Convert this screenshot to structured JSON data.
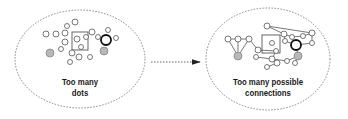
{
  "diagram": {
    "left_panel": {
      "label_line1": "Too many",
      "label_line2": "dots",
      "ellipse": {
        "cx": 80,
        "cy": 59,
        "rx": 65,
        "ry": 49
      },
      "square": {
        "x": 72,
        "y": 32,
        "w": 16,
        "h": 18
      },
      "nodes": [
        {
          "x": 75,
          "y": 22,
          "r": 3,
          "type": "open"
        },
        {
          "x": 67,
          "y": 26,
          "r": 2.5,
          "type": "open"
        },
        {
          "x": 46,
          "y": 34,
          "r": 3,
          "type": "open"
        },
        {
          "x": 56,
          "y": 34,
          "r": 3,
          "type": "open"
        },
        {
          "x": 65,
          "y": 33,
          "r": 3,
          "type": "open"
        },
        {
          "x": 77,
          "y": 39,
          "r": 3,
          "type": "open"
        },
        {
          "x": 86,
          "y": 37,
          "r": 2.5,
          "type": "open"
        },
        {
          "x": 81,
          "y": 47,
          "r": 2.5,
          "type": "open"
        },
        {
          "x": 92,
          "y": 32,
          "r": 3,
          "type": "open"
        },
        {
          "x": 98,
          "y": 37,
          "r": 2.5,
          "type": "open"
        },
        {
          "x": 106,
          "y": 40,
          "r": 5,
          "type": "bold"
        },
        {
          "x": 108,
          "y": 30,
          "r": 2.5,
          "type": "open"
        },
        {
          "x": 116,
          "y": 38,
          "r": 2.5,
          "type": "open"
        },
        {
          "x": 65,
          "y": 42,
          "r": 3,
          "type": "open"
        },
        {
          "x": 50,
          "y": 53,
          "r": 4,
          "type": "filled"
        },
        {
          "x": 61,
          "y": 49,
          "r": 2.5,
          "type": "open"
        },
        {
          "x": 104,
          "y": 51,
          "r": 4,
          "type": "filled"
        },
        {
          "x": 72,
          "y": 53,
          "r": 3,
          "type": "open"
        },
        {
          "x": 79,
          "y": 57,
          "r": 3,
          "type": "open"
        },
        {
          "x": 90,
          "y": 57,
          "r": 2.5,
          "type": "open"
        },
        {
          "x": 70,
          "y": 62,
          "r": 2.5,
          "type": "open"
        }
      ]
    },
    "arrow": {
      "x1": 151,
      "y1": 62,
      "x2": 200,
      "y2": 62,
      "style": "dashed"
    },
    "right_panel": {
      "label_line1": "Too many possible",
      "label_line2": "connections",
      "ellipse": {
        "cx": 268,
        "cy": 59,
        "rx": 62,
        "ry": 51
      },
      "square": {
        "x": 262,
        "y": 35,
        "w": 18,
        "h": 18
      },
      "nodes": [
        {
          "id": "a",
          "x": 228,
          "y": 39,
          "r": 3,
          "type": "open"
        },
        {
          "id": "b",
          "x": 238,
          "y": 39,
          "r": 3,
          "type": "open"
        },
        {
          "id": "c",
          "x": 249,
          "y": 39,
          "r": 3,
          "type": "open"
        },
        {
          "id": "d",
          "x": 238,
          "y": 56,
          "r": 4,
          "type": "filled"
        },
        {
          "id": "e",
          "x": 267,
          "y": 26,
          "r": 3,
          "type": "open"
        },
        {
          "id": "f",
          "x": 312,
          "y": 33,
          "r": 3,
          "type": "open"
        },
        {
          "id": "g",
          "x": 272,
          "y": 43,
          "r": 2.5,
          "type": "open"
        },
        {
          "id": "h",
          "x": 284,
          "y": 34,
          "r": 3,
          "type": "open"
        },
        {
          "id": "i",
          "x": 292,
          "y": 37,
          "r": 2.5,
          "type": "open"
        },
        {
          "id": "j",
          "x": 303,
          "y": 36,
          "r": 2.5,
          "type": "open"
        },
        {
          "id": "k",
          "x": 312,
          "y": 43,
          "r": 2.5,
          "type": "open"
        },
        {
          "id": "l",
          "x": 296,
          "y": 45,
          "r": 5,
          "type": "bold"
        },
        {
          "id": "m",
          "x": 285,
          "y": 41,
          "r": 2.5,
          "type": "open"
        },
        {
          "id": "n",
          "x": 258,
          "y": 50,
          "r": 3,
          "type": "open"
        },
        {
          "id": "o",
          "x": 276,
          "y": 51,
          "r": 2.5,
          "type": "open"
        },
        {
          "id": "p",
          "x": 298,
          "y": 56,
          "r": 4,
          "type": "filled"
        },
        {
          "id": "q",
          "x": 256,
          "y": 57,
          "r": 2.5,
          "type": "open"
        },
        {
          "id": "r",
          "x": 272,
          "y": 59,
          "r": 3,
          "type": "open"
        },
        {
          "id": "s",
          "x": 287,
          "y": 61,
          "r": 2.5,
          "type": "open"
        },
        {
          "id": "t",
          "x": 295,
          "y": 63,
          "r": 2.5,
          "type": "open"
        },
        {
          "id": "u",
          "x": 277,
          "y": 63,
          "r": 3,
          "type": "open"
        },
        {
          "id": "v",
          "x": 267,
          "y": 67,
          "r": 2.5,
          "type": "open"
        }
      ],
      "edges": [
        [
          "a",
          "b"
        ],
        [
          "b",
          "c"
        ],
        [
          "a",
          "d"
        ],
        [
          "b",
          "d"
        ],
        [
          "c",
          "n"
        ],
        [
          "e",
          "f"
        ],
        [
          "h",
          "e"
        ],
        [
          "h",
          "m"
        ],
        [
          "h",
          "i"
        ],
        [
          "i",
          "j"
        ],
        [
          "j",
          "f"
        ],
        [
          "f",
          "k"
        ],
        [
          "k",
          "l"
        ],
        [
          "l",
          "p"
        ],
        [
          "m",
          "l"
        ],
        [
          "n",
          "o"
        ],
        [
          "o",
          "r"
        ],
        [
          "q",
          "r"
        ],
        [
          "r",
          "s"
        ],
        [
          "s",
          "p"
        ],
        [
          "r",
          "u"
        ],
        [
          "u",
          "v"
        ],
        [
          "t",
          "p"
        ],
        [
          "d",
          "c"
        ]
      ]
    },
    "colors": {
      "stroke": "#555555",
      "dashed": "#777777",
      "fill_gray": "#b8b8b8",
      "text": "#1a1a1a"
    }
  }
}
